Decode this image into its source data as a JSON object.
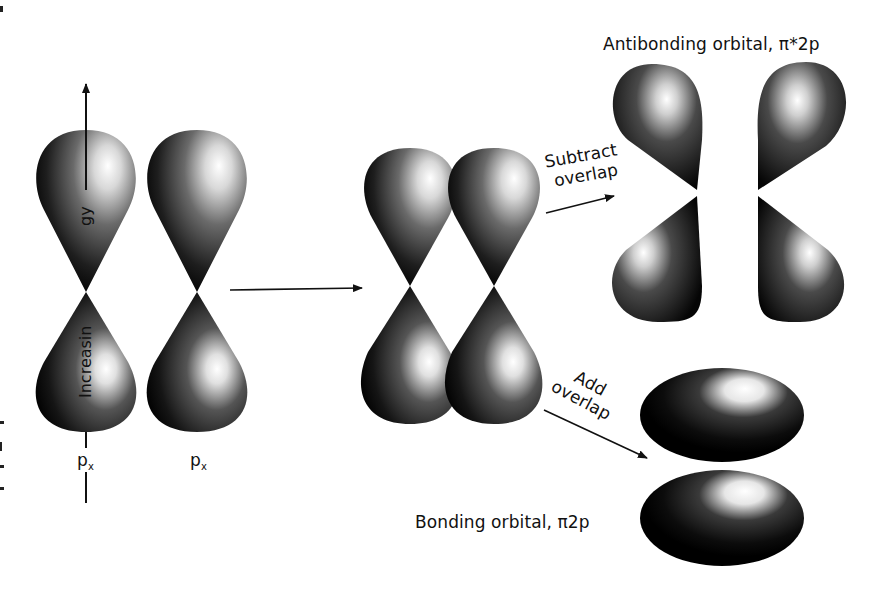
{
  "figure": {
    "antibonding_label": "Antibonding orbital, π*2p",
    "bonding_label": "Bonding orbital, π2p",
    "axis_label_visible_part1": "Increasin",
    "axis_label_visible_part2": "gy",
    "axis_label_full": "Increasing energy",
    "orbital_left_label": "p",
    "orbital_left_sub": "x",
    "orbital_right_label": "p",
    "orbital_right_sub": "x",
    "subtract_line1": "Subtract",
    "subtract_line2": "overlap",
    "add_line1": "Add",
    "add_line2": "overlap"
  },
  "colors": {
    "background": "#ffffff",
    "lobe_dark": "#0a0a0a",
    "lobe_mid": "#5a5a5a",
    "lobe_highlight": "#ffffff",
    "text": "#111111"
  }
}
